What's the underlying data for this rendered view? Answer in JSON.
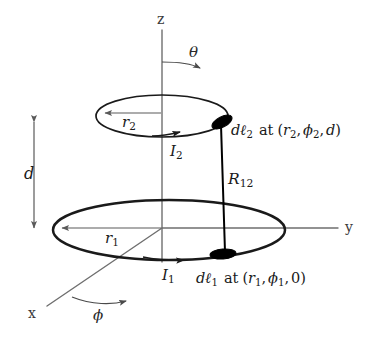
{
  "figure": {
    "background_color": "#ffffff",
    "axis_color": "#6f6f6f",
    "ring_color": "#1a1a1a",
    "element_color": "#000000"
  },
  "axes": {
    "z_label": "z",
    "y_label": "y",
    "x_label": "x",
    "theta_label": "θ",
    "phi_label": "ϕ"
  },
  "dimensions": {
    "separation_label": "d",
    "radius_upper_label": "r",
    "radius_upper_sub": "2",
    "radius_lower_label": "r",
    "radius_lower_sub": "1",
    "distance_label": "R",
    "distance_sub": "12"
  },
  "currents": {
    "upper_label": "I",
    "upper_sub": "2",
    "lower_label": "I",
    "lower_sub": "1"
  },
  "elements": {
    "upper": {
      "d_prefix": "d",
      "ell": "ℓ",
      "sub": "2",
      "at_word": "at",
      "coords": "(r₂, ϕ₂, d)",
      "coord_open": "(",
      "coord_r": "r",
      "coord_r_sub": "2",
      "coord_comma1": ",",
      "coord_phi": "ϕ",
      "coord_phi_sub": "2",
      "coord_comma2": ",",
      "coord_z": "d",
      "coord_close": ")"
    },
    "lower": {
      "d_prefix": "d",
      "ell": "ℓ",
      "sub": "1",
      "at_word": "at",
      "coords": "(r₁, ϕ₁, 0)",
      "coord_open": "(",
      "coord_r": "r",
      "coord_r_sub": "1",
      "coord_comma1": ",",
      "coord_phi": "ϕ",
      "coord_phi_sub": "1",
      "coord_comma2": ",",
      "coord_z": "0",
      "coord_close": ")"
    }
  }
}
